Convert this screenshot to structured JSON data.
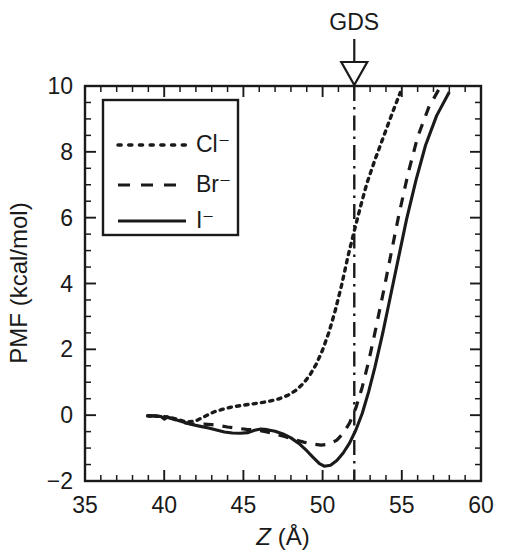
{
  "chart_data": {
    "type": "line",
    "title": "",
    "xlabel": "Z (Å)",
    "ylabel": "PMF (kcal/mol)",
    "xlim": [
      35,
      60
    ],
    "ylim": [
      -2,
      10
    ],
    "xticks": [
      35,
      40,
      45,
      50,
      55,
      60
    ],
    "yticks": [
      -2,
      0,
      2,
      4,
      6,
      8,
      10
    ],
    "xtick_labels": [
      "35",
      "40",
      "45",
      "50",
      "55",
      "60"
    ],
    "ytick_labels": [
      "-2",
      "0",
      "2",
      "4",
      "6",
      "8",
      "10"
    ],
    "x_minor_interval": 1,
    "y_minor_interval": 0.5,
    "grid": false,
    "legend_position": "upper left",
    "annotations": [
      {
        "text": "GDS",
        "x": 52,
        "style": "downward-arrow-with-dash-dot-vertical-line",
        "line_value": 52
      }
    ],
    "series": [
      {
        "name": "Cl⁻",
        "label": "Cl⁻",
        "style": "dotted",
        "color": "#1a1a1a",
        "points": [
          [
            38.95,
            -0.02
          ],
          [
            39.4,
            -0.03
          ],
          [
            39.9,
            -0.04
          ],
          [
            40.3,
            -0.06
          ],
          [
            40.8,
            -0.12
          ],
          [
            41.2,
            -0.18
          ],
          [
            41.6,
            -0.2
          ],
          [
            42.0,
            -0.17
          ],
          [
            42.4,
            -0.08
          ],
          [
            42.8,
            0.02
          ],
          [
            43.2,
            0.11
          ],
          [
            43.7,
            0.18
          ],
          [
            44.2,
            0.24
          ],
          [
            44.8,
            0.29
          ],
          [
            45.4,
            0.33
          ],
          [
            46.0,
            0.37
          ],
          [
            46.6,
            0.42
          ],
          [
            47.2,
            0.49
          ],
          [
            47.8,
            0.6
          ],
          [
            48.3,
            0.75
          ],
          [
            48.8,
            0.97
          ],
          [
            49.2,
            1.22
          ],
          [
            49.6,
            1.55
          ],
          [
            50.0,
            1.98
          ],
          [
            50.4,
            2.52
          ],
          [
            50.8,
            3.18
          ],
          [
            51.2,
            3.95
          ],
          [
            51.6,
            4.82
          ],
          [
            52.0,
            5.6
          ],
          [
            52.4,
            6.35
          ],
          [
            52.8,
            7.05
          ],
          [
            53.3,
            7.75
          ],
          [
            53.8,
            8.4
          ],
          [
            54.3,
            9.05
          ],
          [
            54.9,
            9.8
          ]
        ]
      },
      {
        "name": "Br⁻",
        "label": "Br⁻",
        "style": "dashed",
        "color": "#1a1a1a",
        "points": [
          [
            38.95,
            -0.02
          ],
          [
            39.5,
            -0.03
          ],
          [
            40.0,
            -0.05
          ],
          [
            40.4,
            -0.09
          ],
          [
            40.8,
            -0.15
          ],
          [
            41.2,
            -0.22
          ],
          [
            41.6,
            -0.26
          ],
          [
            42.0,
            -0.27
          ],
          [
            42.5,
            -0.27
          ],
          [
            43.0,
            -0.29
          ],
          [
            43.5,
            -0.32
          ],
          [
            44.0,
            -0.36
          ],
          [
            44.6,
            -0.4
          ],
          [
            45.2,
            -0.43
          ],
          [
            45.8,
            -0.45
          ],
          [
            46.4,
            -0.5
          ],
          [
            47.0,
            -0.57
          ],
          [
            47.6,
            -0.65
          ],
          [
            48.2,
            -0.74
          ],
          [
            48.8,
            -0.82
          ],
          [
            49.4,
            -0.88
          ],
          [
            49.9,
            -0.91
          ],
          [
            50.4,
            -0.88
          ],
          [
            50.9,
            -0.76
          ],
          [
            51.3,
            -0.55
          ],
          [
            51.7,
            -0.24
          ],
          [
            52.1,
            0.22
          ],
          [
            52.5,
            0.85
          ],
          [
            52.9,
            1.62
          ],
          [
            53.3,
            2.5
          ],
          [
            53.8,
            3.65
          ],
          [
            54.3,
            4.85
          ],
          [
            54.8,
            6.05
          ],
          [
            55.4,
            7.35
          ],
          [
            56.0,
            8.45
          ],
          [
            56.7,
            9.35
          ],
          [
            57.4,
            9.95
          ]
        ]
      },
      {
        "name": "I⁻",
        "label": "I⁻",
        "style": "solid",
        "color": "#1a1a1a",
        "points": [
          [
            38.95,
            -0.02
          ],
          [
            39.4,
            -0.02
          ],
          [
            39.8,
            -0.04
          ],
          [
            40.0,
            -0.12
          ],
          [
            40.2,
            -0.06
          ],
          [
            40.6,
            -0.12
          ],
          [
            41.0,
            -0.18
          ],
          [
            41.4,
            -0.24
          ],
          [
            41.8,
            -0.29
          ],
          [
            42.3,
            -0.34
          ],
          [
            42.8,
            -0.39
          ],
          [
            43.3,
            -0.45
          ],
          [
            43.8,
            -0.51
          ],
          [
            44.3,
            -0.54
          ],
          [
            44.8,
            -0.55
          ],
          [
            45.3,
            -0.53
          ],
          [
            45.7,
            -0.46
          ],
          [
            46.1,
            -0.42
          ],
          [
            46.5,
            -0.44
          ],
          [
            47.0,
            -0.49
          ],
          [
            47.5,
            -0.57
          ],
          [
            48.0,
            -0.69
          ],
          [
            48.5,
            -0.86
          ],
          [
            49.0,
            -1.08
          ],
          [
            49.4,
            -1.28
          ],
          [
            49.8,
            -1.47
          ],
          [
            50.1,
            -1.55
          ],
          [
            50.5,
            -1.52
          ],
          [
            50.9,
            -1.38
          ],
          [
            51.3,
            -1.15
          ],
          [
            51.7,
            -0.85
          ],
          [
            52.1,
            -0.45
          ],
          [
            52.5,
            0.05
          ],
          [
            52.9,
            0.7
          ],
          [
            53.3,
            1.45
          ],
          [
            53.8,
            2.5
          ],
          [
            54.3,
            3.65
          ],
          [
            54.8,
            4.8
          ],
          [
            55.3,
            5.95
          ],
          [
            55.9,
            7.15
          ],
          [
            56.5,
            8.2
          ],
          [
            57.2,
            9.1
          ],
          [
            58.0,
            9.82
          ]
        ]
      }
    ]
  },
  "axes": {
    "x_title": "Z (Å)",
    "x_title_symbol": "Z",
    "x_title_unit": "(Å)",
    "y_title": "PMF (kcal/mol)"
  },
  "legend": {
    "entries": [
      {
        "label": "Cl⁻",
        "style": "dotted"
      },
      {
        "label": "Br⁻",
        "style": "dashed"
      },
      {
        "label": "I⁻",
        "style": "solid"
      }
    ]
  },
  "annotation": {
    "gds_label": "GDS"
  },
  "ticks": {
    "x": [
      "35",
      "40",
      "45",
      "50",
      "55",
      "60"
    ],
    "y": [
      "10",
      "8",
      "6",
      "4",
      "2",
      "0",
      "-2"
    ]
  }
}
